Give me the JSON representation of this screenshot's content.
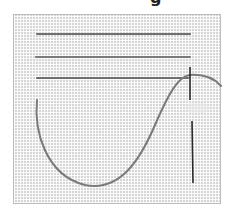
{
  "title_fragment": "g",
  "scene": {
    "description": "Cross-stitch aida fabric with three straight stitched lines, a curved loose thread, and a threaded needle",
    "fabric_color": "#d6d6d6",
    "thread_color": "#6e6e6e",
    "needle_color": "#2a2a2a",
    "stitched_lines": [
      {
        "x1": 37,
        "x2": 190,
        "y": 34
      },
      {
        "x1": 36,
        "x2": 190,
        "y": 57
      },
      {
        "x1": 37,
        "x2": 188,
        "y": 78
      }
    ]
  }
}
